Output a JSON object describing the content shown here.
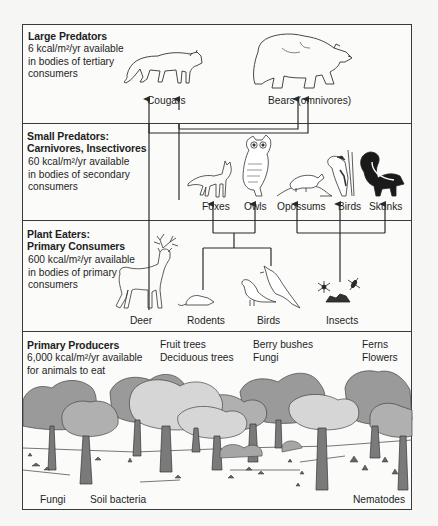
{
  "diagram": {
    "type": "food-energy-pyramid",
    "levels": [
      {
        "id": "large-predators",
        "title": "Large Predators",
        "energy_value": "6",
        "energy_line1": "6 kcal/m²/yr available",
        "energy_line2": "in bodies of tertiary",
        "energy_line3": "consumers",
        "organisms": [
          {
            "label": "Cougars",
            "icon": "cougar-icon"
          },
          {
            "label": "Bears (omnivores)",
            "icon": "bear-icon"
          }
        ]
      },
      {
        "id": "small-predators",
        "title_line1": "Small Predators:",
        "title_line2": "Carnivores, Insectivores",
        "energy_value": "60",
        "energy_line1": "60 kcal/m²/yr available",
        "energy_line2": "in bodies of secondary",
        "energy_line3": "consumers",
        "organisms": [
          {
            "label": "Foxes",
            "icon": "fox-icon"
          },
          {
            "label": "Owls",
            "icon": "owl-icon"
          },
          {
            "label": "Opossums",
            "icon": "opossum-icon"
          },
          {
            "label": "Birds",
            "icon": "woodpecker-icon"
          },
          {
            "label": "Skunks",
            "icon": "skunk-icon"
          }
        ]
      },
      {
        "id": "plant-eaters",
        "title_line1": "Plant Eaters:",
        "title_line2": "Primary Consumers",
        "energy_value": "600",
        "energy_line1": "600 kcal/m²/yr available",
        "energy_line2": "in bodies of primary",
        "energy_line3": "consumers",
        "organisms": [
          {
            "label": "Deer",
            "icon": "deer-icon"
          },
          {
            "label": "Rodents",
            "icon": "rodent-icon"
          },
          {
            "label": "Birds",
            "icon": "songbird-icon"
          },
          {
            "label": "Insects",
            "icon": "insect-icon"
          }
        ]
      },
      {
        "id": "primary-producers",
        "title": "Primary Producers",
        "energy_value": "6,000",
        "energy_line1": "6,000 kcal/m²/yr available",
        "energy_line2": "for animals to eat",
        "producer_groups": [
          {
            "line1": "Fruit trees",
            "line2": "Deciduous trees"
          },
          {
            "line1": "Berry bushes",
            "line2": "Fungi"
          },
          {
            "line1": "Ferns",
            "line2": "Flowers"
          }
        ],
        "decomposers": [
          "Fungi",
          "Soil bacteria",
          "Nematodes"
        ]
      }
    ],
    "connections": [
      {
        "from": "Deer",
        "to": "Cougars"
      },
      {
        "from": "Foxes",
        "to": "Cougars"
      },
      {
        "from": "Foxes",
        "to": "Bears (omnivores)"
      },
      {
        "from": "Owls",
        "to": "Bears (omnivores)"
      },
      {
        "from": "Rodents",
        "to": "Foxes"
      },
      {
        "from": "Rodents",
        "to": "Owls"
      },
      {
        "from": "Birds",
        "to": "Foxes"
      },
      {
        "from": "Birds",
        "to": "Owls"
      },
      {
        "from": "Insects",
        "to": "Opossums"
      },
      {
        "from": "Insects",
        "to": "Birds"
      },
      {
        "from": "Insects",
        "to": "Skunks"
      }
    ],
    "colors": {
      "line": "#2a2a2a",
      "border": "#3a3a3a",
      "tree_dark": "#8f8f8f",
      "tree_mid": "#a9a9a9",
      "tree_light": "#d4d4d4",
      "background": "#fbfbfa"
    }
  }
}
